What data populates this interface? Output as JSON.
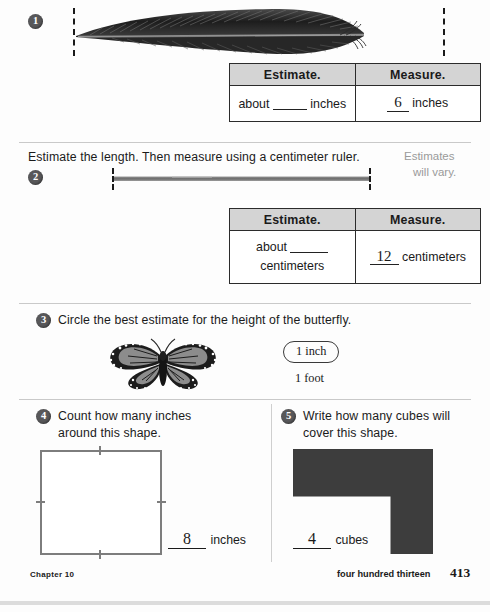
{
  "page": {
    "background_color": "#fdfdfd",
    "badge_color": "#58585a",
    "rule_color": "#c9c9c9"
  },
  "questions": [
    {
      "number": "1",
      "object": "feather-image",
      "table": {
        "headers": [
          "Estimate.",
          "Measure."
        ],
        "estimate_prefix": "about",
        "estimate_value": "",
        "estimate_unit": "inches",
        "measure_value": "6",
        "measure_unit": "inches"
      }
    },
    {
      "number": "2",
      "instruction": "Estimate the length. Then measure using a centimeter ruler.",
      "note_line1": "Estimates",
      "note_line2": "will vary.",
      "object": "gray-rod-image",
      "table": {
        "headers": [
          "Estimate.",
          "Measure."
        ],
        "estimate_prefix": "about",
        "estimate_value": "",
        "estimate_unit": "centimeters",
        "measure_value": "12",
        "measure_unit": "centimeters"
      }
    },
    {
      "number": "3",
      "instruction": "Circle the best estimate for the height of the butterfly.",
      "object": "monarch-butterfly-image",
      "choices": [
        {
          "label": "1 inch",
          "selected": true
        },
        {
          "label": "1 foot",
          "selected": false
        }
      ]
    },
    {
      "number": "4",
      "instruction_line1": "Count how many inches",
      "instruction_line2": "around this shape.",
      "object": "square-shape",
      "answer_value": "8",
      "answer_unit": "inches"
    },
    {
      "number": "5",
      "instruction_line1": "Write how many cubes will",
      "instruction_line2": "cover this shape.",
      "object": "l-shape",
      "answer_value": "4",
      "answer_unit": "cubes"
    }
  ],
  "footer": {
    "chapter": "Chapter 10",
    "page_words": "four hundred thirteen",
    "page_number": "413"
  }
}
